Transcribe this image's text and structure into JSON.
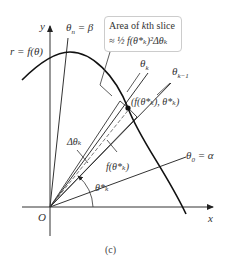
{
  "figure": {
    "caption": "(c)",
    "axes": {
      "x_label": "x",
      "y_label": "y",
      "origin_label": "O"
    },
    "curve_label": "r = f(θ)",
    "rays": {
      "theta_n": {
        "symbol": "θ",
        "sub": "n",
        "suffix": " = β"
      },
      "theta_k": {
        "symbol": "θ",
        "sub": "k"
      },
      "theta_k_minus_1": {
        "symbol": "θ",
        "sub": "k−1"
      },
      "theta_0": {
        "symbol": "θ",
        "sub": "0",
        "suffix": " = α"
      }
    },
    "callout": {
      "line1_prefix": "Area of ",
      "line1_k": "k",
      "line1_suffix": "th slice",
      "line2": "≈ ½ f(θ*ₖ)²Δθₖ"
    },
    "point_label": "(f(θ*ₖ), θ*ₖ)",
    "delta_label": "Δθₖ",
    "radius_label": "f(θ*ₖ)",
    "angle_label": "θ*ₖ"
  }
}
